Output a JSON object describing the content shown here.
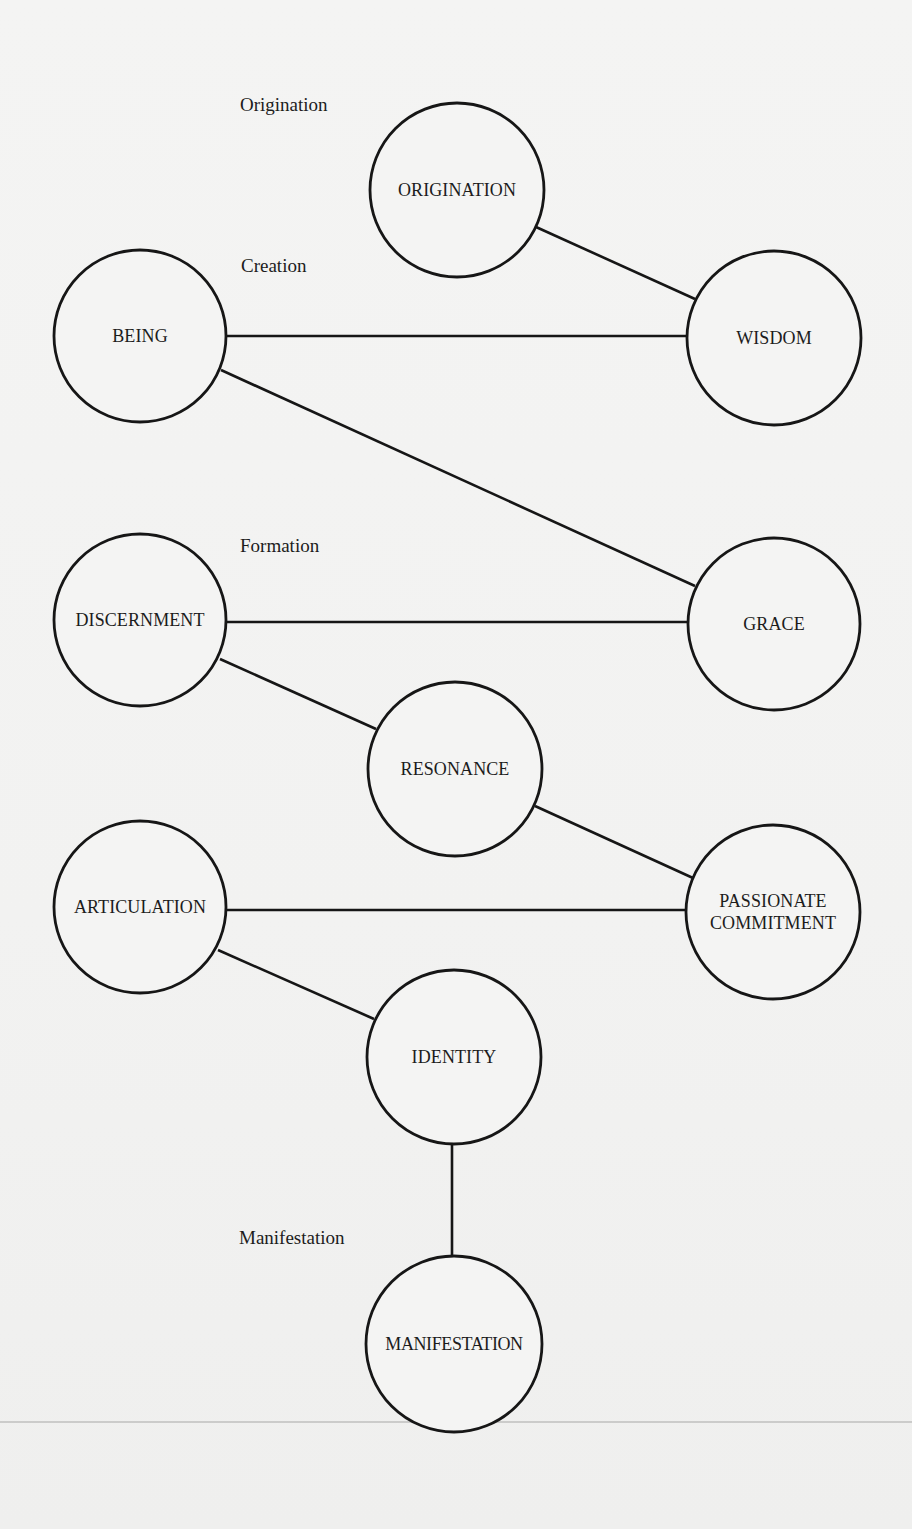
{
  "diagram": {
    "stages": [
      {
        "id": "origination",
        "label": "Origination",
        "x": 240,
        "y": 94
      },
      {
        "id": "creation",
        "label": "Creation",
        "x": 241,
        "y": 255
      },
      {
        "id": "formation",
        "label": "Formation",
        "x": 240,
        "y": 535
      },
      {
        "id": "manifestation",
        "label": "Manifestation",
        "x": 239,
        "y": 1227
      }
    ],
    "nodes": [
      {
        "id": "origination",
        "label": "ORIGINATION",
        "cx": 457,
        "cy": 190,
        "r": 87
      },
      {
        "id": "being",
        "label": "BEING",
        "cx": 140,
        "cy": 336,
        "r": 86
      },
      {
        "id": "wisdom",
        "label": "WISDOM",
        "cx": 774,
        "cy": 338,
        "r": 87
      },
      {
        "id": "discernment",
        "label": "DISCERNMENT",
        "cx": 140,
        "cy": 620,
        "r": 86
      },
      {
        "id": "grace",
        "label": "GRACE",
        "cx": 774,
        "cy": 624,
        "r": 86
      },
      {
        "id": "resonance",
        "label": "RESONANCE",
        "cx": 455,
        "cy": 769,
        "r": 87
      },
      {
        "id": "articulation",
        "label": "ARTICULATION",
        "cx": 140,
        "cy": 907,
        "r": 86
      },
      {
        "id": "passionate-commitment",
        "label": "PASSIONATE\nCOMMITMENT",
        "cx": 773,
        "cy": 912,
        "r": 87
      },
      {
        "id": "identity",
        "label": "IDENTITY",
        "cx": 454,
        "cy": 1057,
        "r": 87
      },
      {
        "id": "manifestation",
        "label": "MANIFESTATION",
        "cx": 454,
        "cy": 1344,
        "r": 88
      }
    ],
    "edges": [
      {
        "from": "origination",
        "to": "wisdom",
        "x1": 536,
        "y1": 227,
        "x2": 695,
        "y2": 299
      },
      {
        "from": "being",
        "to": "wisdom",
        "x1": 226,
        "y1": 336,
        "x2": 688,
        "y2": 336
      },
      {
        "from": "being",
        "to": "grace",
        "x1": 221,
        "y1": 370,
        "x2": 695,
        "y2": 586
      },
      {
        "from": "discernment",
        "to": "grace",
        "x1": 226,
        "y1": 622,
        "x2": 688,
        "y2": 622
      },
      {
        "from": "discernment",
        "to": "resonance",
        "x1": 220,
        "y1": 659,
        "x2": 376,
        "y2": 729
      },
      {
        "from": "resonance",
        "to": "passionate-commitment",
        "x1": 535,
        "y1": 806,
        "x2": 693,
        "y2": 878
      },
      {
        "from": "articulation",
        "to": "passionate-commitment",
        "x1": 226,
        "y1": 910,
        "x2": 686,
        "y2": 910
      },
      {
        "from": "articulation",
        "to": "identity",
        "x1": 218,
        "y1": 950,
        "x2": 374,
        "y2": 1019
      },
      {
        "from": "identity",
        "to": "manifestation",
        "x1": 452,
        "y1": 1144,
        "x2": 452,
        "y2": 1256
      }
    ],
    "colors": {
      "background": "#f3f3f2",
      "ink": "#161616"
    }
  }
}
